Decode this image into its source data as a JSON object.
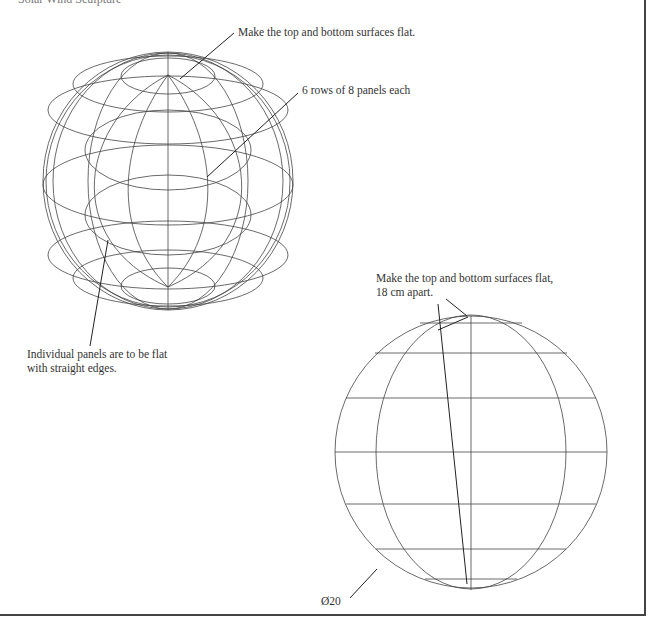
{
  "title": "Solar Wind Sculpture",
  "annotations": {
    "top_flat": "Make the top and bottom surfaces flat.",
    "rows": "6 rows of 8 panels each",
    "panels_line1": "Individual panels are to be flat",
    "panels_line2": "with straight edges.",
    "top_flat_apart_line1": "Make the top and bottom surfaces flat,",
    "top_flat_apart_line2": "18 cm apart.",
    "diameter": "Ø20"
  },
  "figures": {
    "perspective_view": {
      "rows": 6,
      "panels_per_row": 8
    },
    "elevation_view": {
      "diameter_label": "Ø20",
      "flat_separation": "18 cm"
    }
  },
  "colors": {
    "line": "#333333",
    "background": "#ffffff",
    "border": "#444444"
  }
}
